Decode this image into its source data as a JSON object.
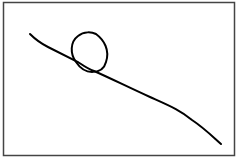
{
  "diagram": {
    "stroke_color": "#000000",
    "frame_color": "#444444",
    "background": "#ffffff"
  }
}
